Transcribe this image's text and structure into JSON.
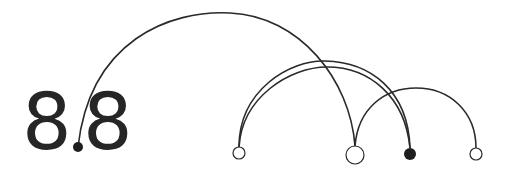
{
  "diagram": {
    "type": "arc-diagram",
    "label": {
      "left_digit": "8",
      "right_digit": "8",
      "full_text": "8.8"
    },
    "colors": {
      "stroke": "#2a2a2a",
      "fill_node": "#1e1e1e",
      "background": "#ffffff"
    },
    "nodes": [
      {
        "id": "dot",
        "x": 78,
        "y": 147,
        "r": 5,
        "filled": true
      },
      {
        "id": "n1",
        "x": 239,
        "y": 153,
        "r": 6,
        "filled": false
      },
      {
        "id": "n2",
        "x": 355,
        "y": 155,
        "r": 9,
        "filled": false
      },
      {
        "id": "n3",
        "x": 410,
        "y": 154,
        "r": 6,
        "filled": true
      },
      {
        "id": "n4",
        "x": 476,
        "y": 154,
        "r": 6,
        "filled": false
      }
    ],
    "arcs": [
      {
        "from": "dot",
        "to": "n2"
      },
      {
        "from": "n1",
        "to": "n3"
      },
      {
        "from": "n1",
        "to": "n3"
      },
      {
        "from": "n2",
        "to": "n4"
      }
    ]
  }
}
